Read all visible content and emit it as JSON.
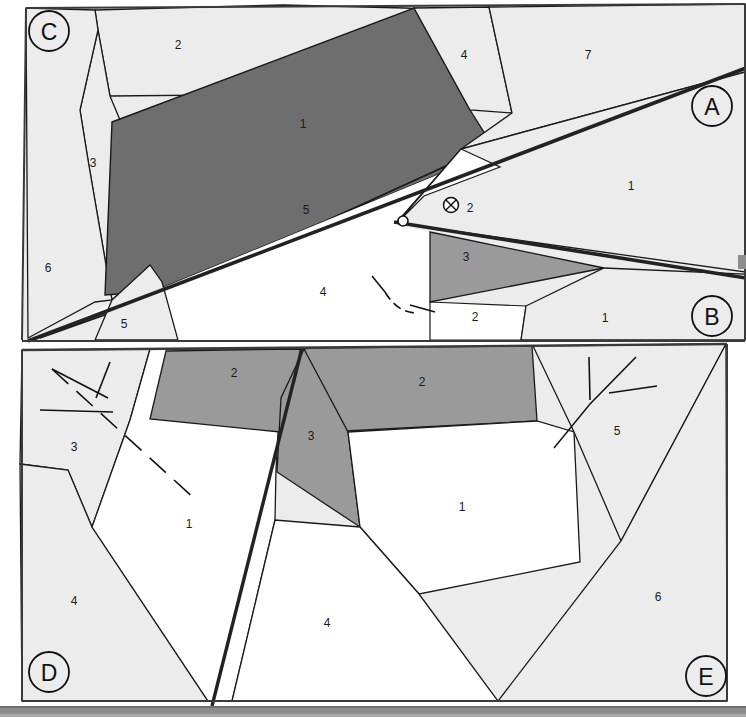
{
  "figure": {
    "background_color": "#ffffff",
    "page_edge_color": "#8a8a8a"
  },
  "colors": {
    "white_unit": "#ffffff",
    "light_gray_unit": "#ececec",
    "medium_gray_unit": "#9a9a9a",
    "dark_gray_unit": "#6e6e6e",
    "line": "#1a1a1a",
    "thick_fault": "#222222",
    "page_strip": "#8d8d8d"
  },
  "panel_letters": [
    {
      "label": "C",
      "x": 49,
      "y": 31,
      "r": 20
    },
    {
      "label": "A",
      "x": 712,
      "y": 106,
      "r": 20
    },
    {
      "label": "B",
      "x": 712,
      "y": 316,
      "r": 20
    },
    {
      "label": "D",
      "x": 49,
      "y": 672,
      "r": 20
    },
    {
      "label": "E",
      "x": 706,
      "y": 676,
      "r": 20
    }
  ],
  "upper_panel": {
    "name": "upper-map-panel",
    "units": [
      {
        "id": "u-c-2",
        "label": "2",
        "x": 178,
        "y": 46,
        "fill": "#ececec",
        "points": "95,10 283,5 405,8 430,9 400,55 372,97 338,94 110,96 98,30"
      },
      {
        "id": "u-c-3",
        "label": "3",
        "x": 93,
        "y": 164,
        "fill": "#ececec",
        "points": "98,30 110,96 120,120 150,265 110,300 88,160 80,110"
      },
      {
        "id": "u-c-6",
        "label": "6",
        "x": 48,
        "y": 269,
        "fill": "#ececec",
        "points": "26,8 95,10 98,30 80,110 88,160 110,300 95,300 28,338"
      },
      {
        "id": "u-c-5",
        "label": "5",
        "x": 124,
        "y": 325,
        "fill": "#ececec",
        "points": "110,300 150,265 160,280 176,340 95,340"
      },
      {
        "id": "u-dark-1",
        "label": "1",
        "x": 303,
        "y": 125,
        "fill": "#6e6e6e",
        "points": "112,122 414,8 470,110 492,145 175,290 105,295"
      },
      {
        "id": "u-4",
        "label": "4",
        "x": 464,
        "y": 56,
        "fill": "#ececec",
        "points": "414,8 488,8 510,112 470,110"
      },
      {
        "id": "u-7",
        "label": "7",
        "x": 588,
        "y": 56,
        "fill": "#ececec",
        "points": "488,8 745,5 745,70 460,148 510,112"
      },
      {
        "id": "u-band-5",
        "label": "5",
        "x": 306,
        "y": 211,
        "fill": "#6e6e6e",
        "points": "175,290 492,145 512,142 40,338"
      },
      {
        "id": "u-a-1",
        "label": "1",
        "x": 631,
        "y": 187,
        "fill": "#ececec",
        "points": "745,72 745,270 395,222 460,150"
      },
      {
        "id": "u-wh-2",
        "label": "2",
        "x": 470,
        "y": 209,
        "fill": "#ffffff",
        "points": "425,192 498,166 460,150 398,222 418,216"
      },
      {
        "id": "u-3wedge",
        "label": "3",
        "x": 466,
        "y": 258,
        "fill": "#9a9a9a",
        "points": "430,232 600,268 430,300"
      },
      {
        "id": "u-wh-4",
        "label": "4",
        "x": 323,
        "y": 293,
        "fill": "#ffffff",
        "points": "400,222 430,232 430,300 430,340 176,340 160,280"
      },
      {
        "id": "u-wh-2b",
        "label": "2",
        "x": 475,
        "y": 318,
        "fill": "#ffffff",
        "points": "430,300 524,305 520,340 430,340"
      },
      {
        "id": "u-b-1",
        "label": "1",
        "x": 605,
        "y": 319,
        "fill": "#ececec",
        "points": "524,305 600,268 745,272 745,340 520,340"
      }
    ],
    "symbols": [
      {
        "type": "circle-x-icon",
        "x": 451,
        "y": 205,
        "r": 8
      },
      {
        "type": "small-circle-icon",
        "x": 403,
        "y": 221,
        "r": 5
      },
      {
        "type": "strike-dip-icon",
        "x": 400,
        "y": 293
      }
    ]
  },
  "lower_panel": {
    "name": "lower-map-panel",
    "units": [
      {
        "id": "l-3",
        "label": "3",
        "x": 74,
        "y": 448,
        "fill": "#ececec",
        "points": "22,350 148,350 130,420 92,525 68,470 20,464"
      },
      {
        "id": "l-4a",
        "label": "4",
        "x": 74,
        "y": 602,
        "fill": "#ececec",
        "points": "20,464 68,470 92,525 208,700 22,700"
      },
      {
        "id": "l-1a",
        "label": "1",
        "x": 189,
        "y": 525,
        "fill": "#ffffff",
        "points": "148,350 165,352 298,350 300,360 275,520 232,700 208,700 92,525 130,420"
      },
      {
        "id": "l-2a",
        "label": "2",
        "x": 234,
        "y": 374,
        "fill": "#9a9a9a",
        "points": "165,352 298,350 300,360 278,430 150,418"
      },
      {
        "id": "l-3b",
        "label": "3",
        "x": 311,
        "y": 437,
        "fill": "#9a9a9a",
        "points": "303,350 345,430 358,525 276,470 280,400"
      },
      {
        "id": "l-2b",
        "label": "2",
        "x": 422,
        "y": 383,
        "fill": "#9a9a9a",
        "points": "310,350 530,348 535,420 345,430 303,350"
      },
      {
        "id": "l-1b",
        "label": "1",
        "x": 462,
        "y": 508,
        "fill": "#ffffff",
        "points": "345,430 535,420 572,430 578,560 418,592 358,525"
      },
      {
        "id": "l-4b",
        "label": "4",
        "x": 327,
        "y": 624,
        "fill": "#ffffff",
        "points": "358,525 418,592 498,700 232,700 275,520"
      },
      {
        "id": "l-5",
        "label": "5",
        "x": 617,
        "y": 432,
        "fill": "#ececec",
        "points": "535,348 725,345 620,540 572,430"
      },
      {
        "id": "l-6",
        "label": "6",
        "x": 658,
        "y": 598,
        "fill": "#ececec",
        "points": "725,345 727,700 498,700 620,540"
      }
    ],
    "symbols": [
      {
        "type": "strike-dip-icon",
        "x": 80,
        "y": 390
      },
      {
        "type": "dashed-fault-icon",
        "x": 120,
        "y": 440
      },
      {
        "type": "strike-dip-icon",
        "x": 600,
        "y": 385
      }
    ]
  }
}
